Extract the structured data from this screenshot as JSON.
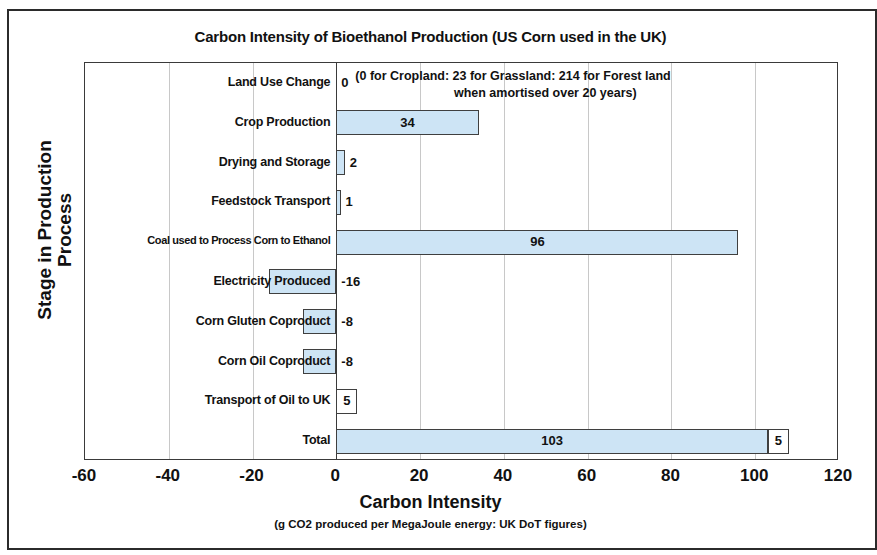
{
  "chart_data": {
    "type": "bar",
    "orientation": "horizontal",
    "title": "Carbon Intensity of Bioethanol Production (US Corn used in the UK)",
    "xlabel": "Carbon Intensity",
    "x_sublabel": "(g CO2 produced per MegaJoule energy: UK DoT figures)",
    "ylabel_line1": "Stage in Production",
    "ylabel_line2": "Process",
    "xlim": [
      -60,
      120
    ],
    "xticks": [
      -60,
      -40,
      -20,
      0,
      20,
      40,
      60,
      80,
      100,
      120
    ],
    "xtick_labels": [
      "-60",
      "-40",
      "-20",
      "0",
      "20",
      "40",
      "60",
      "80",
      "100",
      "120"
    ],
    "grid": true,
    "legend": "none",
    "bar_color": "#cde4f5",
    "bar_border_color": "#3f3f3f",
    "categories": [
      "Land Use Change",
      "Crop Production",
      "Drying and Storage",
      "Feedstock Transport",
      "Coal used to Process Corn to Ethanol",
      "Electricity Produced",
      "Corn Gluten Coproduct",
      "Corn Oil Coproduct",
      "Transport of Oil to UK",
      "Total"
    ],
    "values": [
      0,
      34,
      2,
      1,
      96,
      -16,
      -8,
      -8,
      5,
      103
    ],
    "value_labels": [
      "0",
      "34",
      "2",
      "1",
      "96",
      "-16",
      "-8",
      "-8",
      "5",
      "103"
    ],
    "bars": [
      {
        "category": "Land Use Change",
        "value": 0,
        "label": "0",
        "label_position": "outside",
        "style": "none"
      },
      {
        "category": "Crop Production",
        "value": 34,
        "label": "34",
        "label_position": "inside",
        "style": "filled"
      },
      {
        "category": "Drying and Storage",
        "value": 2,
        "label": "2",
        "label_position": "outside",
        "style": "filled"
      },
      {
        "category": "Feedstock Transport",
        "value": 1,
        "label": "1",
        "label_position": "outside",
        "style": "filled"
      },
      {
        "category": "Coal used to Process Corn to Ethanol",
        "value": 96,
        "label": "96",
        "label_position": "inside",
        "style": "filled"
      },
      {
        "category": "Electricity Produced",
        "value": -16,
        "label": "-16",
        "label_position": "outside",
        "style": "filled"
      },
      {
        "category": "Corn Gluten Coproduct",
        "value": -8,
        "label": "-8",
        "label_position": "outside",
        "style": "filled"
      },
      {
        "category": "Corn Oil Coproduct",
        "value": -8,
        "label": "-8",
        "label_position": "outside",
        "style": "filled"
      },
      {
        "category": "Transport of Oil to UK",
        "value": 5,
        "label": "5",
        "label_position": "inside",
        "style": "hollow"
      },
      {
        "category": "Total",
        "value": 103,
        "label": "103",
        "label_position": "inside",
        "style": "filled"
      }
    ],
    "total_extra_segment": {
      "category": "Total",
      "start": 103,
      "end": 108,
      "value": 5,
      "label": "5",
      "style": "hollow"
    },
    "annotations": [
      {
        "target": "Land Use Change",
        "line1": "(0 for Cropland: 23 for Grassland: 214 for Forest land",
        "line2": "when amortised over 20 years)"
      }
    ]
  }
}
